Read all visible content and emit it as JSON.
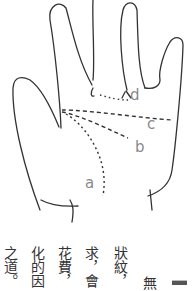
{
  "figure": {
    "labels": {
      "a": "a",
      "b": "b",
      "c": "c",
      "d": "d"
    }
  },
  "text": {
    "columns": [
      "狀紋，",
      "求，會",
      "花費，",
      "化的因",
      "之道。"
    ],
    "extra_char": "無"
  }
}
